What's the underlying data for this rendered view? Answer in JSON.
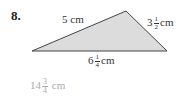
{
  "problem": {
    "number": "8.",
    "shape": "triangle",
    "fill_color": "#dcdcdc",
    "stroke_color": "#444444",
    "vertices": [
      [
        32,
        51
      ],
      [
        126,
        11
      ],
      [
        167,
        51
      ]
    ],
    "sides": {
      "left": {
        "whole": "5",
        "unit": "cm"
      },
      "right": {
        "whole": "3",
        "num": "1",
        "den": "2",
        "unit": "cm"
      },
      "bottom": {
        "whole": "6",
        "num": "1",
        "den": "4",
        "unit": "cm"
      }
    },
    "answer": {
      "whole": "14",
      "num": "3",
      "den": "4",
      "unit": "cm"
    }
  }
}
